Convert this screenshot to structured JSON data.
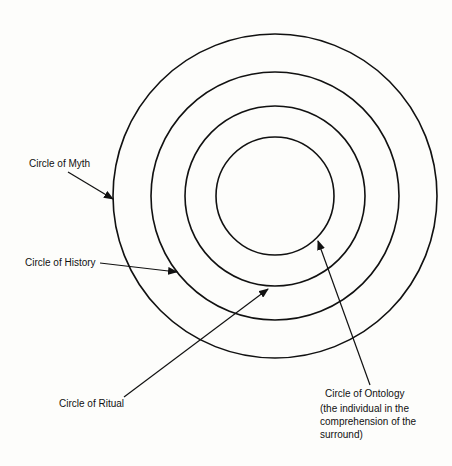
{
  "diagram": {
    "center": {
      "x": 275,
      "y": 196
    },
    "stroke_color": "#111111",
    "background": "#fdfdfb",
    "circles": [
      {
        "name": "Circle of Myth",
        "r": 162
      },
      {
        "name": "Circle of History",
        "r": 124
      },
      {
        "name": "Circle of Ritual",
        "r": 90
      },
      {
        "name": "Circle of Ontology",
        "r": 59
      }
    ],
    "labels": {
      "myth": "Circle of Myth",
      "history": "Circle of History",
      "ritual": "Circle of Ritual",
      "ontology": "Circle of Ontology",
      "ontology_description": "(the individual in the comprehension of the surround)"
    },
    "arrows": [
      {
        "target": "myth",
        "from": [
          68,
          172
        ],
        "to": [
          113,
          199
        ]
      },
      {
        "target": "history",
        "from": [
          100,
          263
        ],
        "to": [
          177,
          272
        ]
      },
      {
        "target": "ritual",
        "from": [
          124,
          397
        ],
        "to": [
          268,
          289
        ]
      },
      {
        "target": "ontology",
        "from": [
          370,
          385
        ],
        "to": [
          318,
          241
        ]
      }
    ]
  }
}
